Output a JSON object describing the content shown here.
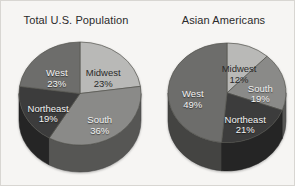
{
  "figure": {
    "background_color": "#f6f5f3",
    "border_color": "#d8d6d2"
  },
  "chart_data": [
    {
      "type": "pie",
      "title": "Total U.S. Population",
      "categories": [
        "Midwest",
        "South",
        "Northeast",
        "West"
      ],
      "values": [
        23,
        36,
        19,
        23
      ],
      "value_suffix": "%",
      "labels": [
        "23%",
        "36%",
        "19%",
        "23%"
      ],
      "colors": [
        "#b9b9b7",
        "#8a8a88",
        "#3c3c3c",
        "#6d6d6b"
      ],
      "label_text_colors": [
        "#2a2a2a",
        "#f2f2f2",
        "#f2f2f2",
        "#f2f2f2"
      ],
      "start_angle_deg": 0,
      "direction": "clockwise",
      "legend": "none",
      "three_d": true
    },
    {
      "type": "pie",
      "title": "Asian Americans",
      "categories": [
        "Midwest",
        "South",
        "Northeast",
        "West"
      ],
      "values": [
        12,
        19,
        21,
        49
      ],
      "value_suffix": "%",
      "labels": [
        "12%",
        "19%",
        "21%",
        "49%"
      ],
      "colors": [
        "#b9b9b7",
        "#8a8a88",
        "#3c3c3c",
        "#6d6d6b"
      ],
      "label_text_colors": [
        "#2a2a2a",
        "#f2f2f2",
        "#f2f2f2",
        "#f2f2f2"
      ],
      "start_angle_deg": 0,
      "direction": "clockwise",
      "legend": "none",
      "three_d": true
    }
  ]
}
